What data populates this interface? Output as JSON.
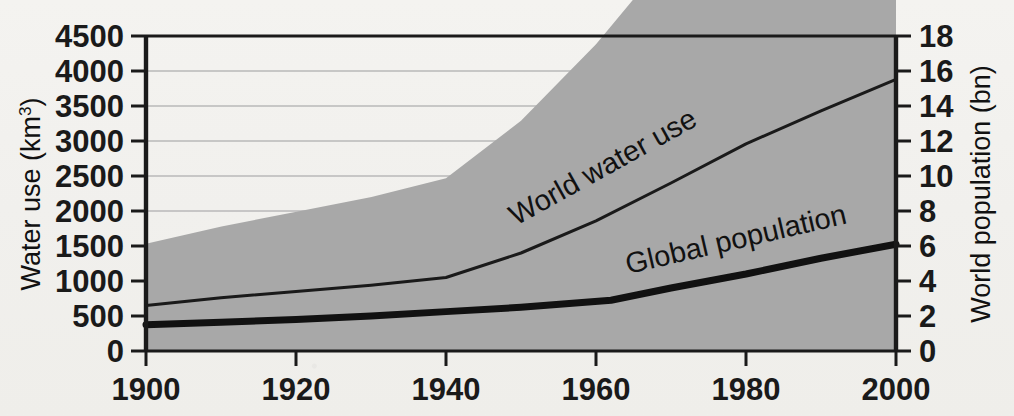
{
  "chart_data": {
    "type": "area",
    "title": "",
    "subtitle": "",
    "xlabel": "",
    "xlim": [
      1900,
      2000
    ],
    "x_ticks": [
      1900,
      1920,
      1940,
      1960,
      1980,
      2000
    ],
    "x_tick_labels": [
      "1900",
      "1920",
      "1940",
      "1960",
      "1980",
      "2000"
    ],
    "grid": true,
    "grid_axis": "y",
    "legend_position": "inline-on-series",
    "axes": {
      "left": {
        "label": "Water use (km",
        "label_superscript": "3",
        "label_suffix": ")",
        "full_label": "Water use (km3)",
        "unit": "km³",
        "ylim": [
          0,
          4500
        ],
        "tick_step": 500,
        "ticks": [
          0,
          500,
          1000,
          1500,
          2000,
          2500,
          3000,
          3500,
          4000,
          4500
        ],
        "tick_labels": [
          "0",
          "500",
          "1000",
          "1500",
          "2000",
          "2500",
          "3000",
          "3500",
          "4000",
          "4500"
        ]
      },
      "right": {
        "label": "World population (bn)",
        "unit": "bn",
        "ylim": [
          0,
          18
        ],
        "tick_step": 2,
        "ticks": [
          0,
          2,
          4,
          6,
          8,
          10,
          12,
          14,
          16,
          18
        ],
        "tick_labels": [
          "0",
          "2",
          "4",
          "6",
          "8",
          "10",
          "12",
          "14",
          "16",
          "18"
        ]
      }
    },
    "series": [
      {
        "name": "World water use",
        "label": "World water use",
        "axis": "left",
        "render": "area",
        "fill_color": "#a8a8a8",
        "line_color": "#1a1a1a",
        "line_width": 3,
        "x": [
          1900,
          1910,
          1920,
          1930,
          1940,
          1950,
          1960,
          1970,
          1980,
          1990,
          2000
        ],
        "values": [
          650,
          760,
          850,
          940,
          1050,
          1400,
          1860,
          2400,
          2960,
          3430,
          3880
        ]
      },
      {
        "name": "Global population",
        "label": "Global population",
        "axis": "right",
        "render": "line",
        "line_color": "#111111",
        "line_width": 7,
        "x": [
          1900,
          1910,
          1920,
          1930,
          1940,
          1950,
          1962,
          1970,
          1980,
          1990,
          2000
        ],
        "values": [
          1.5,
          1.65,
          1.8,
          2.0,
          2.25,
          2.5,
          2.9,
          3.6,
          4.4,
          5.3,
          6.1
        ]
      }
    ],
    "annotations": [
      {
        "text": "World water use",
        "x": 1968,
        "y_left": 2250,
        "rotation": -29
      },
      {
        "text": "Global population",
        "x": 1981,
        "y_right": 5.3,
        "rotation": -13
      }
    ]
  },
  "colors": {
    "area_fill": "#a8a8a8",
    "axis": "#1a1a1a",
    "gridline": "#b9b9b9",
    "background": "#f2f1ee",
    "text": "#111111"
  }
}
